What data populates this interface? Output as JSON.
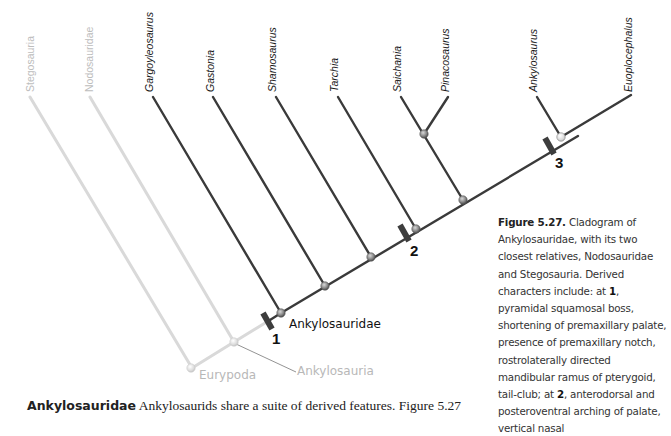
{
  "figure": {
    "taxa": [
      {
        "name": "Stegosauria",
        "style": "light"
      },
      {
        "name": "Nodosauridae",
        "style": "light"
      },
      {
        "name": "Gargoyleosaurus",
        "style": "dark"
      },
      {
        "name": "Gastonia",
        "style": "dark"
      },
      {
        "name": "Shamosaurus",
        "style": "dark"
      },
      {
        "name": "Tarchia",
        "style": "dark"
      },
      {
        "name": "Saichania",
        "style": "dark"
      },
      {
        "name": "Pinacosaurus",
        "style": "dark"
      },
      {
        "name": "Ankylosaurus",
        "style": "dark"
      },
      {
        "name": "Euoplocephalus",
        "style": "dark"
      }
    ],
    "clades": {
      "ankylosauridae": "Ankylosauridae",
      "eurypoda": "Eurypoda",
      "ankylosauria": "Ankylosauria"
    },
    "character_marks": [
      "1",
      "2",
      "3"
    ],
    "colors": {
      "dark_branch": "#3a3a3a",
      "light_branch": "#d6d6d6",
      "node_fill": "#9a9a9a"
    }
  },
  "caption": {
    "figure_label": "Figure 5.27.",
    "text_a": " Cladogram of Ankylosauridae, with its two closest relatives, Nodosauridae and Stegosauria. Derived characters include: at ",
    "mark1": "1",
    "text_b": ", pyramidal squamosal boss, shortening of premaxillary palate, presence of premaxillary notch, rostrolaterally directed mandibular ramus of pterygoid, tail-club; at ",
    "mark2": "2",
    "text_c": ", anterodorsal and posteroventral arching of palate, vertical nasal"
  },
  "body": {
    "heading": "Ankylosauridae",
    "text": " Ankylosaurids share a suite of derived features. Figure 5.27"
  }
}
